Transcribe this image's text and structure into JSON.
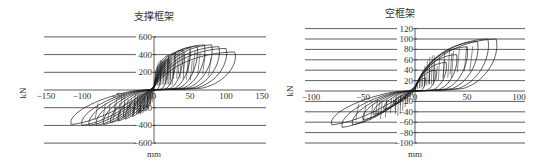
{
  "chart_data": [
    {
      "type": "line",
      "title": "支撑框架",
      "xlabel": "mm",
      "ylabel": "kN",
      "xlim": [
        -150,
        150
      ],
      "ylim": [
        -600,
        600
      ],
      "xticks": [
        -150,
        -100,
        -50,
        0,
        50,
        100,
        150
      ],
      "yticks": [
        600,
        400,
        200,
        0,
        -200,
        -400,
        -600
      ],
      "grid": "horizontal",
      "series": [
        {
          "name": "hysteresis loops",
          "description": "Cyclic load-displacement hysteresis loops, braced frame; peak ~+500 kN at ~+75 mm, ~-400 kN at ~-110 mm",
          "positive_peaks": [
            [
              10,
              330
            ],
            [
              20,
              390
            ],
            [
              30,
              420
            ],
            [
              40,
              450
            ],
            [
              50,
              480
            ],
            [
              60,
              500
            ],
            [
              70,
              510
            ],
            [
              80,
              510
            ],
            [
              90,
              490
            ],
            [
              100,
              470
            ],
            [
              112,
              430
            ]
          ],
          "negative_peaks": [
            [
              -10,
              -200
            ],
            [
              -20,
              -260
            ],
            [
              -30,
              -300
            ],
            [
              -40,
              -330
            ],
            [
              -50,
              -350
            ],
            [
              -60,
              -370
            ],
            [
              -70,
              -390
            ],
            [
              -80,
              -400
            ],
            [
              -90,
              -400
            ],
            [
              -100,
              -400
            ],
            [
              -115,
              -390
            ]
          ]
        }
      ],
      "layout": {
        "px_x0": 154,
        "px_per_unit_x": 0.72,
        "px_y0": 90,
        "px_per_unit_y": 0.0885,
        "grid_x_left": 44,
        "grid_x_right": 266,
        "title_x": 154,
        "title_y": 20,
        "ylabel_x": 26,
        "ylabel_y": 93,
        "xlabel_x": 154,
        "xlabel_y": 157
      }
    },
    {
      "type": "line",
      "title": "空框架",
      "xlabel": "mm",
      "ylabel": "kN",
      "xlim": [
        -100,
        100
      ],
      "ylim": [
        -100,
        120
      ],
      "xticks": [
        -100,
        -50,
        0,
        50,
        100
      ],
      "yticks": [
        120,
        100,
        80,
        60,
        40,
        20,
        0,
        -20,
        -40,
        -60,
        -80,
        -100
      ],
      "grid": "horizontal",
      "series": [
        {
          "name": "hysteresis loops",
          "description": "Cyclic load-displacement hysteresis loops, bare frame; peak ~+100 kN at ~+75 mm, ~-70 kN at ~-80 mm",
          "positive_peaks": [
            [
              10,
              25
            ],
            [
              20,
              40
            ],
            [
              30,
              55
            ],
            [
              40,
              70
            ],
            [
              50,
              85
            ],
            [
              60,
              95
            ],
            [
              70,
              100
            ],
            [
              78,
              100
            ]
          ],
          "negative_peaks": [
            [
              -10,
              -15
            ],
            [
              -20,
              -25
            ],
            [
              -30,
              -35
            ],
            [
              -40,
              -45
            ],
            [
              -50,
              -55
            ],
            [
              -60,
              -65
            ],
            [
              -70,
              -70
            ],
            [
              -80,
              -65
            ]
          ]
        }
      ],
      "layout": {
        "px_x0": 415,
        "px_per_unit_x": 1.04,
        "px_y0": 91,
        "px_per_unit_y": 0.52,
        "grid_x_left": 305,
        "grid_x_right": 525,
        "title_x": 400,
        "title_y": 17,
        "ylabel_x": 293,
        "ylabel_y": 91,
        "xlabel_x": 415,
        "xlabel_y": 157
      }
    }
  ],
  "colors": {
    "line": "#1a1a1a",
    "grid": "#333333",
    "text": "#333333",
    "background": "#ffffff"
  }
}
